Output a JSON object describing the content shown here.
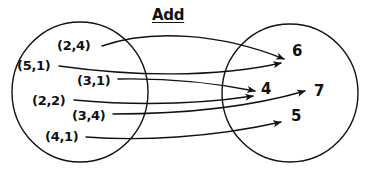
{
  "title": {
    "text": "Add",
    "x": 152,
    "y": 8
  },
  "colors": {
    "ink": "#111111",
    "background": "#ffffff"
  },
  "domain_set": {
    "name": "domain-oval",
    "shape": "ellipse",
    "cx": 80,
    "cy": 92,
    "rx": 68,
    "ry": 70,
    "items": [
      {
        "label": "(2,4)",
        "x": 57,
        "y": 39
      },
      {
        "label": "(5,1)",
        "x": 17,
        "y": 59
      },
      {
        "label": "(3,1)",
        "x": 77,
        "y": 74
      },
      {
        "label": "(2,2)",
        "x": 32,
        "y": 94
      },
      {
        "label": "(3,4)",
        "x": 72,
        "y": 109
      },
      {
        "label": "(4,1)",
        "x": 45,
        "y": 130
      }
    ]
  },
  "codomain_set": {
    "name": "codomain-oval",
    "shape": "ellipse",
    "cx": 290,
    "cy": 93,
    "rx": 68,
    "ry": 69,
    "items": [
      {
        "label": "6",
        "x": 292,
        "y": 44
      },
      {
        "label": "4",
        "x": 261,
        "y": 82
      },
      {
        "label": "7",
        "x": 314,
        "y": 84
      },
      {
        "label": "5",
        "x": 291,
        "y": 109
      }
    ]
  },
  "mappings": [
    {
      "from": "(2,4)",
      "to": "6",
      "path": "M 102 46 C 150 29, 220 33, 284 59"
    },
    {
      "from": "(5,1)",
      "to": "6",
      "path": "M 59 66 C 130 76, 215 78, 281 63"
    },
    {
      "from": "(3,1)",
      "to": "4",
      "path": "M 118 79 C 170 78, 215 83, 255 91"
    },
    {
      "from": "(2,2)",
      "to": "4",
      "path": "M 74 100 C 140 106, 200 104, 253 96"
    },
    {
      "from": "(3,4)",
      "to": "7",
      "path": "M 113 114 C 170 114, 240 110, 305 91"
    },
    {
      "from": "(4,1)",
      "to": "5",
      "path": "M 86 137 C 140 141, 210 138, 281 122"
    }
  ]
}
